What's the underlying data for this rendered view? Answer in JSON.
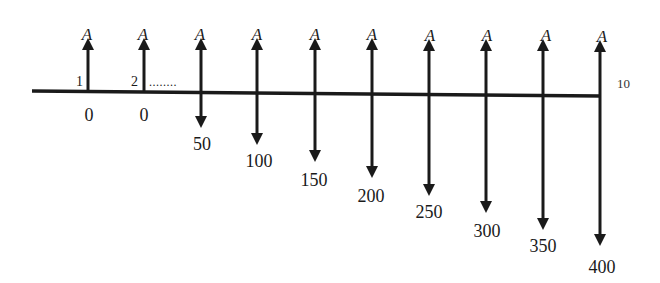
{
  "diagram": {
    "type": "cash-flow-diagram",
    "colors": {
      "line": "#1a1a1a",
      "background": "#ffffff"
    },
    "timeline": {
      "start_label_period_1": "1",
      "start_label_period_2": "2",
      "ellipsis": "........",
      "end_label": "10"
    },
    "up_arrow_label": "A",
    "periods": [
      {
        "period": 1,
        "up_label": "A",
        "down_label": "0"
      },
      {
        "period": 2,
        "up_label": "A",
        "down_label": "0"
      },
      {
        "period": 3,
        "up_label": "A",
        "down_label": "50"
      },
      {
        "period": 4,
        "up_label": "A",
        "down_label": "100"
      },
      {
        "period": 5,
        "up_label": "A",
        "down_label": "150"
      },
      {
        "period": 6,
        "up_label": "A",
        "down_label": "200"
      },
      {
        "period": 7,
        "up_label": "A",
        "down_label": "250"
      },
      {
        "period": 8,
        "up_label": "A",
        "down_label": "300"
      },
      {
        "period": 9,
        "up_label": "A",
        "down_label": "350"
      },
      {
        "period": 10,
        "up_label": "A",
        "down_label": "400"
      }
    ]
  }
}
